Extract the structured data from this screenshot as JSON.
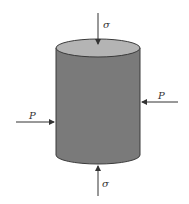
{
  "diagram": {
    "labels": {
      "sigma_top": "σ",
      "sigma_bottom": "σ",
      "p_left": "P",
      "p_right": "P"
    },
    "colors": {
      "body": "#7a7a7a",
      "top_face": "#b4b4b4",
      "outline": "#3a3a3a",
      "arrow": "#333333"
    }
  }
}
